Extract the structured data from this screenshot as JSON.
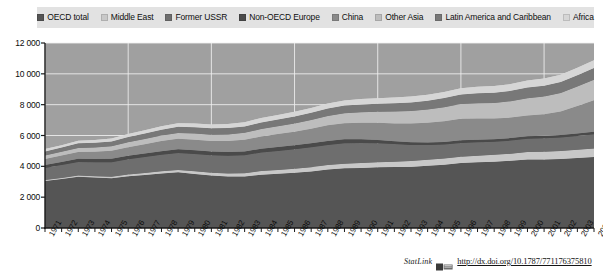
{
  "legend": {
    "position": "top",
    "items": [
      {
        "label": "OECD total",
        "color": "#555555"
      },
      {
        "label": "Middle East",
        "color": "#c8c8c8"
      },
      {
        "label": "Former USSR",
        "color": "#6e6e6e"
      },
      {
        "label": "Non-OECD Europe",
        "color": "#4a4a4a"
      },
      {
        "label": "China",
        "color": "#8a8a8a"
      },
      {
        "label": "Other Asia",
        "color": "#bdbdbd"
      },
      {
        "label": "Latin America and Caribbean",
        "color": "#787878"
      },
      {
        "label": "Africa",
        "color": "#d6d6d6"
      }
    ]
  },
  "axes": {
    "y_ticks": [
      "12 000",
      "10 000",
      "8 000",
      "6 000",
      "4 000",
      "2 000",
      "0"
    ],
    "x_ticks": [
      "1971",
      "1972",
      "1973",
      "1974",
      "1975",
      "1976",
      "1977",
      "1978",
      "1979",
      "1980",
      "1981",
      "1982",
      "1983",
      "1984",
      "1985",
      "1986",
      "1987",
      "1988",
      "1989",
      "1990",
      "1991",
      "1992",
      "1993",
      "1994",
      "1995",
      "1996",
      "1997",
      "1998",
      "1999",
      "2000",
      "2001",
      "2002",
      "2003",
      "2004"
    ]
  },
  "footer": {
    "statlink_label": "StatLink",
    "statlink_icon": "spreadsheet-icon",
    "url": "http://dx.doi.org/10.1787/771176375810"
  },
  "colors": {
    "plot_background": "#a0a0a0",
    "gridline": "#f0f0f0",
    "legend_background": "#e2e2e2",
    "axis": "#1a1a1a"
  },
  "chart_data": {
    "type": "area",
    "stacked": true,
    "title": "",
    "xlabel": "",
    "ylabel": "",
    "ylim": [
      0,
      12000
    ],
    "y_tick_step": 2000,
    "grid": true,
    "legend_position": "top",
    "x": [
      1971,
      1972,
      1973,
      1974,
      1975,
      1976,
      1977,
      1978,
      1979,
      1980,
      1981,
      1982,
      1983,
      1984,
      1985,
      1986,
      1987,
      1988,
      1989,
      1990,
      1991,
      1992,
      1993,
      1994,
      1995,
      1996,
      1997,
      1998,
      1999,
      2000,
      2001,
      2002,
      2003,
      2004
    ],
    "categories": [
      "1971",
      "1972",
      "1973",
      "1974",
      "1975",
      "1976",
      "1977",
      "1978",
      "1979",
      "1980",
      "1981",
      "1982",
      "1983",
      "1984",
      "1985",
      "1986",
      "1987",
      "1988",
      "1989",
      "1990",
      "1991",
      "1992",
      "1993",
      "1994",
      "1995",
      "1996",
      "1997",
      "1998",
      "1999",
      "2000",
      "2001",
      "2002",
      "2003",
      "2004"
    ],
    "series": [
      {
        "name": "OECD total",
        "color": "#555555",
        "values": [
          3050,
          3180,
          3330,
          3270,
          3220,
          3360,
          3440,
          3530,
          3610,
          3510,
          3400,
          3340,
          3340,
          3460,
          3520,
          3580,
          3670,
          3790,
          3870,
          3900,
          3940,
          3960,
          3980,
          4040,
          4110,
          4210,
          4260,
          4300,
          4360,
          4450,
          4450,
          4480,
          4540,
          4600
        ]
      },
      {
        "name": "Middle East",
        "color": "#c8c8c8",
        "values": [
          60,
          70,
          80,
          90,
          100,
          115,
          130,
          145,
          160,
          170,
          185,
          200,
          215,
          235,
          250,
          265,
          275,
          290,
          305,
          320,
          330,
          345,
          360,
          380,
          395,
          410,
          430,
          445,
          460,
          480,
          495,
          510,
          530,
          555
        ]
      },
      {
        "name": "Former USSR",
        "color": "#6e6e6e",
        "values": [
          790,
          830,
          870,
          910,
          950,
          990,
          1030,
          1070,
          1100,
          1120,
          1130,
          1150,
          1170,
          1200,
          1230,
          1260,
          1290,
          1310,
          1320,
          1300,
          1230,
          1140,
          1050,
          960,
          910,
          900,
          870,
          850,
          850,
          860,
          870,
          880,
          900,
          920
        ]
      },
      {
        "name": "Non-OECD Europe",
        "color": "#4a4a4a",
        "values": [
          190,
          195,
          205,
          210,
          215,
          220,
          228,
          235,
          240,
          242,
          240,
          240,
          242,
          248,
          252,
          256,
          258,
          260,
          256,
          235,
          210,
          190,
          178,
          170,
          168,
          170,
          168,
          165,
          160,
          160,
          162,
          163,
          165,
          168
        ]
      },
      {
        "name": "China",
        "color": "#8a8a8a",
        "values": [
          390,
          420,
          445,
          470,
          520,
          560,
          610,
          660,
          680,
          690,
          690,
          710,
          750,
          800,
          850,
          890,
          950,
          1010,
          1050,
          1070,
          1110,
          1150,
          1210,
          1270,
          1340,
          1390,
          1370,
          1340,
          1330,
          1350,
          1400,
          1520,
          1780,
          2050
        ]
      },
      {
        "name": "Other Asia",
        "color": "#bdbdbd",
        "values": [
          230,
          245,
          265,
          275,
          290,
          310,
          330,
          355,
          380,
          395,
          410,
          430,
          455,
          480,
          505,
          530,
          565,
          605,
          645,
          685,
          725,
          770,
          815,
          860,
          910,
          960,
          1000,
          1010,
          1060,
          1110,
          1150,
          1200,
          1260,
          1320
        ]
      },
      {
        "name": "Latin America and Caribbean",
        "color": "#787878",
        "values": [
          260,
          275,
          295,
          310,
          320,
          340,
          360,
          380,
          395,
          405,
          410,
          415,
          415,
          425,
          435,
          450,
          465,
          480,
          495,
          505,
          520,
          540,
          555,
          575,
          595,
          620,
          645,
          665,
          675,
          700,
          700,
          710,
          730,
          760
        ]
      },
      {
        "name": "Africa",
        "color": "#d6d6d6",
        "values": [
          150,
          160,
          170,
          180,
          190,
          200,
          215,
          225,
          235,
          245,
          255,
          265,
          275,
          285,
          295,
          305,
          315,
          325,
          335,
          345,
          355,
          365,
          375,
          385,
          395,
          410,
          420,
          430,
          440,
          455,
          465,
          480,
          495,
          515
        ]
      }
    ],
    "totals": [
      5120,
      5375,
      5660,
      5715,
      5805,
      6095,
      6343,
      6600,
      6800,
      6777,
      6720,
      6750,
      6862,
      7133,
      7337,
      7536,
      7748,
      8070,
      8276,
      8360,
      8420,
      8460,
      8523,
      8640,
      8823,
      9070,
      9163,
      9205,
      9335,
      9565,
      9692,
      9943,
      10400,
      10888
    ]
  }
}
